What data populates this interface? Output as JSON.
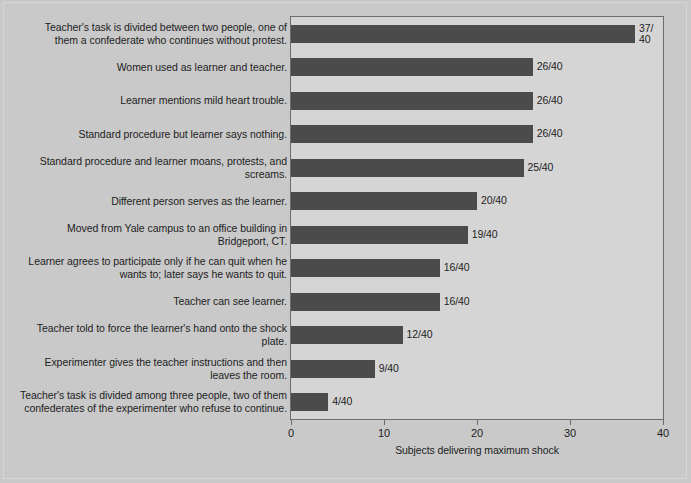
{
  "chart_data": {
    "type": "bar",
    "orientation": "horizontal",
    "title": "",
    "xlabel": "Subjects delivering maximum shock",
    "ylabel": "",
    "xlim": [
      0,
      40
    ],
    "xticks": [
      "0",
      "10",
      "20",
      "30",
      "40"
    ],
    "grid": false,
    "legend": null,
    "denominator": 40,
    "categories": [
      "Teacher's task is divided between two people, one of them a confederate who continues without protest.",
      "Women used as learner and teacher.",
      "Learner mentions mild heart trouble.",
      "Standard procedure but learner says nothing.",
      "Standard procedure and learner moans, protests, and screams.",
      "Different person serves as the learner.",
      "Moved from Yale campus to an office building in Bridgeport, CT.",
      "Learner agrees to participate only if he can quit when he wants to; later says he wants to quit.",
      "Teacher can see learner.",
      "Teacher told to force the learner's hand onto the shock plate.",
      "Experimenter gives the teacher instructions and then leaves the room.",
      "Teacher's task is divided among three people, two of them confederates of the experimenter who refuse to continue."
    ],
    "values": [
      37,
      26,
      26,
      26,
      25,
      20,
      19,
      16,
      16,
      12,
      9,
      4
    ],
    "data_labels": [
      "37/\n40",
      "26/40",
      "26/40",
      "26/40",
      "25/40",
      "20/40",
      "19/40",
      "16/40",
      "16/40",
      "12/40",
      "9/40",
      "4/40"
    ]
  },
  "style": {
    "bar_color": "#4b4b4b",
    "plot_background": "#d5d5d5",
    "figure_background": "#c9c9c9",
    "axis_color": "#6d6d6d",
    "text_color": "#1d1d1d"
  }
}
